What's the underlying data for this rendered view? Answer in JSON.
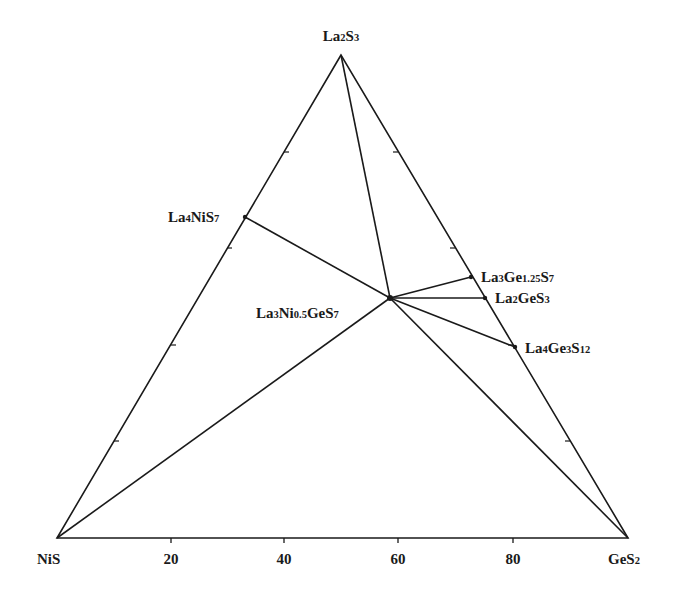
{
  "diagram": {
    "type": "ternary-phase-diagram",
    "colors": {
      "line": "#1a1a1a",
      "background": "#ffffff"
    },
    "vertices": {
      "top": {
        "id": "La2S3",
        "parts": [
          [
            "La",
            ""
          ],
          [
            "2",
            "sub"
          ],
          [
            "S",
            ""
          ],
          [
            "3",
            "sub"
          ]
        ],
        "x": 341,
        "y": 55
      },
      "left": {
        "id": "NiS",
        "parts": [
          [
            "NiS",
            ""
          ]
        ],
        "x": 57,
        "y": 538
      },
      "right": {
        "id": "GeS2",
        "parts": [
          [
            "GeS",
            ""
          ],
          [
            "2",
            "sub"
          ]
        ],
        "x": 628,
        "y": 538
      }
    },
    "bottom_axis": {
      "ticks": [
        {
          "label": "20",
          "x": 171
        },
        {
          "label": "40",
          "x": 284
        },
        {
          "label": "60",
          "x": 398
        },
        {
          "label": "80",
          "x": 513
        }
      ]
    },
    "compounds": [
      {
        "id": "La4NiS7",
        "label": "La₄NiS₇",
        "parts": [
          [
            "La",
            ""
          ],
          [
            "4",
            "sub"
          ],
          [
            "NiS",
            ""
          ],
          [
            "7",
            "sub"
          ]
        ],
        "x": 245,
        "y": 217,
        "label_x": 168,
        "label_y": 222,
        "anchor": "start"
      },
      {
        "id": "La3Ni0.5GeS7",
        "label": "La₃Ni₀.₅GeS₇",
        "parts": [
          [
            "La",
            ""
          ],
          [
            "3",
            "sub"
          ],
          [
            "Ni",
            ""
          ],
          [
            "0.5",
            "sub"
          ],
          [
            "GeS",
            ""
          ],
          [
            "7",
            "sub"
          ]
        ],
        "x": 390,
        "y": 298,
        "label_x": 256,
        "label_y": 318,
        "anchor": "start"
      },
      {
        "id": "La3Ge1.25S7",
        "label": "La₃Ge₁.₂₅S₇",
        "parts": [
          [
            "La",
            ""
          ],
          [
            "3",
            "sub"
          ],
          [
            "Ge",
            ""
          ],
          [
            "1.25",
            "sub"
          ],
          [
            "S",
            ""
          ],
          [
            "7",
            "sub"
          ]
        ],
        "x": 471,
        "y": 277,
        "label_x": 481,
        "label_y": 282,
        "anchor": "start"
      },
      {
        "id": "La2GeS3",
        "label": "La₂GeS₃",
        "parts": [
          [
            "La",
            ""
          ],
          [
            "2",
            "sub"
          ],
          [
            "GeS",
            ""
          ],
          [
            "3",
            "sub"
          ]
        ],
        "x": 485,
        "y": 298,
        "label_x": 495,
        "label_y": 303,
        "anchor": "start"
      },
      {
        "id": "La4Ge3S12",
        "label": "La₄Ge₃S₁₂",
        "parts": [
          [
            "La",
            ""
          ],
          [
            "4",
            "sub"
          ],
          [
            "Ge",
            ""
          ],
          [
            "3",
            "sub"
          ],
          [
            "S",
            ""
          ],
          [
            "12",
            "sub"
          ]
        ],
        "x": 515,
        "y": 347,
        "label_x": 525,
        "label_y": 353,
        "anchor": "start"
      }
    ],
    "tie_lines": [
      [
        "La2S3",
        "La3Ni0.5GeS7"
      ],
      [
        "La4NiS7",
        "La3Ni0.5GeS7"
      ],
      [
        "NiS",
        "La3Ni0.5GeS7"
      ],
      [
        "GeS2",
        "La3Ni0.5GeS7"
      ],
      [
        "La3Ge1.25S7",
        "La3Ni0.5GeS7"
      ],
      [
        "La2GeS3",
        "La3Ni0.5GeS7"
      ],
      [
        "La4Ge3S12",
        "La3Ni0.5GeS7"
      ]
    ],
    "side_ticks": {
      "left": [
        [
          284,
          152
        ],
        [
          227,
          248
        ],
        [
          171,
          345
        ],
        [
          114,
          441
        ]
      ],
      "right": [
        [
          398,
          152
        ],
        [
          455,
          248
        ],
        [
          513,
          345
        ],
        [
          570,
          441
        ]
      ]
    }
  }
}
